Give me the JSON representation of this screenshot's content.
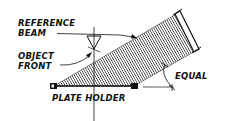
{
  "diagram": {
    "labels": {
      "reference_beam_line1": "REFERENCE",
      "reference_beam_line2": "BEAM",
      "object_front_line1": "OBJECT",
      "object_front_line2": "FRONT",
      "plate_holder": "PLATE HOLDER",
      "equal": "EQUAL"
    },
    "colors": {
      "ink": "#111111",
      "background": "#ffffff",
      "hatch": "#333333"
    }
  }
}
